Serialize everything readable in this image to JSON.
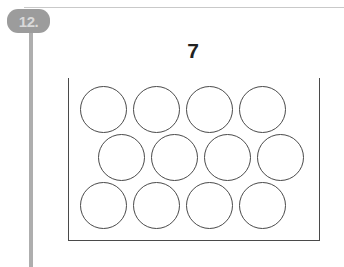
{
  "item": {
    "badge_label": "12.",
    "badge_color": "#9c9c9c",
    "badge_text_color": "#d9d9d9"
  },
  "rules": {
    "top_rule_color": "#c9c9c9",
    "spine_color": "#aeaeae"
  },
  "problem": {
    "target_number": "7",
    "number_color": "#222222"
  },
  "tray": {
    "outline_color": "#4a4a4a",
    "open_top": true,
    "counter_outline_color": "#4a4a4a",
    "total_counters": 12,
    "rows": [
      {
        "name": "top-row",
        "count": 4,
        "offset": "aligned-left"
      },
      {
        "name": "middle-row",
        "count": 4,
        "offset": "shifted-right"
      },
      {
        "name": "bottom-row",
        "count": 4,
        "offset": "aligned-left"
      }
    ]
  }
}
